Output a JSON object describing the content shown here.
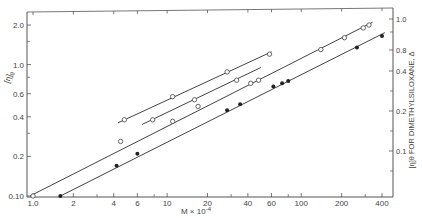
{
  "chart_data": {
    "type": "line",
    "title": "",
    "xlabel": "M × 10⁻⁴",
    "ylabel_left": "[η]θ",
    "ylabel_right": "[η]θ FOR DIMETHYLSILOXANE, Δ",
    "x_scale": "log",
    "y_scale": "log",
    "xlim": [
      0.95,
      450
    ],
    "ylim_left": [
      0.1,
      2.4
    ],
    "grid": false,
    "x_ticks": [
      1.0,
      2,
      4,
      6,
      10,
      20,
      40,
      60,
      100,
      200,
      400
    ],
    "x_tick_labels": [
      "1.0",
      "2",
      "4",
      "6",
      "10",
      "20",
      "40",
      "60",
      "100",
      "200",
      "400"
    ],
    "y_left_ticks": [
      0.1,
      0.2,
      0.4,
      0.6,
      1.0,
      2.0
    ],
    "y_left_tick_labels": [
      "0.10",
      "0.2",
      "0.4",
      "0.6",
      "1.0",
      "2.0"
    ],
    "y_right_tick_labels": [
      "1.0",
      "0.8",
      "0.4",
      "0.2",
      "0.1"
    ],
    "series": [
      {
        "name": "dimethylsiloxane (Δ, right axis)",
        "marker": "open-triangle",
        "line": {
          "x": [
            4.3,
            60
          ],
          "y": [
            0.36,
            1.25
          ]
        },
        "points": [
          {
            "x": 4.8,
            "y": 0.38
          },
          {
            "x": 11,
            "y": 0.57
          },
          {
            "x": 28,
            "y": 0.88
          },
          {
            "x": 58,
            "y": 1.2
          }
        ]
      },
      {
        "name": "series 2 (open circles, short line)",
        "marker": "open-circle",
        "line": {
          "x": [
            6.5,
            50
          ],
          "y": [
            0.35,
            0.95
          ]
        },
        "points": [
          {
            "x": 7.8,
            "y": 0.38
          },
          {
            "x": 16,
            "y": 0.54
          },
          {
            "x": 33,
            "y": 0.76
          }
        ]
      },
      {
        "name": "series 3 (open circles)",
        "marker": "open-circle",
        "line": {
          "x": [
            0.95,
            340
          ],
          "y": [
            0.1,
            2.1
          ]
        },
        "points": [
          {
            "x": 1.0,
            "y": 0.1
          },
          {
            "x": 4.5,
            "y": 0.26
          },
          {
            "x": 11,
            "y": 0.37
          },
          {
            "x": 17,
            "y": 0.48
          },
          {
            "x": 42,
            "y": 0.72
          },
          {
            "x": 48,
            "y": 0.76
          },
          {
            "x": 140,
            "y": 1.3
          },
          {
            "x": 210,
            "y": 1.6
          },
          {
            "x": 290,
            "y": 1.9
          },
          {
            "x": 320,
            "y": 2.0
          }
        ]
      },
      {
        "name": "series 4 (filled circles)",
        "marker": "filled-circle",
        "line": {
          "x": [
            1.6,
            420
          ],
          "y": [
            0.1,
            1.75
          ]
        },
        "points": [
          {
            "x": 1.6,
            "y": 0.1
          },
          {
            "x": 4.2,
            "y": 0.17
          },
          {
            "x": 6.0,
            "y": 0.21
          },
          {
            "x": 28,
            "y": 0.45
          },
          {
            "x": 35,
            "y": 0.5
          },
          {
            "x": 62,
            "y": 0.68
          },
          {
            "x": 72,
            "y": 0.72
          },
          {
            "x": 80,
            "y": 0.75
          },
          {
            "x": 260,
            "y": 1.35
          },
          {
            "x": 400,
            "y": 1.65
          }
        ]
      }
    ]
  },
  "labels": {
    "xlabel": "M × 10",
    "xlabel_exp": "-4",
    "ylabel_left": "[η]",
    "ylabel_left_sub": "θ",
    "ylabel_right": "[η]θ FOR DIMETHYLSILOXANE, Δ"
  }
}
